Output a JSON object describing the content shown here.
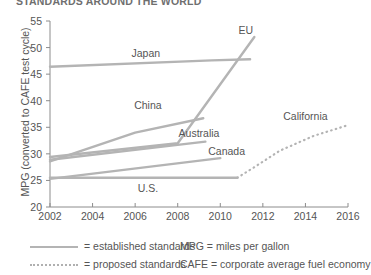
{
  "title": "STANDARDS AROUND THE WORLD",
  "chart_data": {
    "type": "line",
    "title": "STANDARDS AROUND THE WORLD",
    "xlabel": "",
    "ylabel": "MPG (converted to CAFE test cycle)",
    "xlim": [
      2002,
      2016
    ],
    "ylim": [
      20,
      55
    ],
    "xticks": [
      "2002",
      "2004",
      "2006",
      "2008",
      "2010",
      "2012",
      "2014",
      "2016"
    ],
    "yticks": [
      "55",
      "50",
      "45",
      "40",
      "35",
      "30",
      "25",
      "20"
    ],
    "grid": false,
    "legend_position": "below-axis",
    "series": [
      {
        "name": "EU",
        "style": "established",
        "label_x": 2011.2,
        "label_y": 53.4,
        "points": [
          [
            2002,
            29.4
          ],
          [
            2008,
            32.0
          ],
          [
            2011.6,
            52.0
          ]
        ]
      },
      {
        "name": "Japan",
        "style": "established",
        "label_x": 2006.5,
        "label_y": 49.0,
        "points": [
          [
            2002,
            46.4
          ],
          [
            2009.6,
            47.6
          ],
          [
            2011.4,
            47.8
          ]
        ]
      },
      {
        "name": "China",
        "style": "established",
        "label_x": 2006.6,
        "label_y": 39.2,
        "points": [
          [
            2002,
            28.6
          ],
          [
            2006.0,
            34.0
          ],
          [
            2009.2,
            36.7
          ]
        ]
      },
      {
        "name": "Australia",
        "style": "established",
        "label_x": 2009.0,
        "label_y": 34.0,
        "points": [
          [
            2002,
            28.9
          ],
          [
            2009.3,
            32.3
          ]
        ]
      },
      {
        "name": "Canada",
        "style": "established",
        "label_x": 2010.3,
        "label_y": 30.5,
        "points": [
          [
            2002,
            25.3
          ],
          [
            2010.0,
            29.2
          ]
        ]
      },
      {
        "name": "U.S.",
        "style": "established",
        "label_x": 2006.6,
        "label_y": 23.6,
        "points": [
          [
            2002,
            25.5
          ],
          [
            2010.8,
            25.5
          ]
        ]
      },
      {
        "name": "California",
        "style": "proposed",
        "label_x": 2014.0,
        "label_y": 37.2,
        "points": [
          [
            2010.8,
            25.5
          ],
          [
            2011.6,
            27.5
          ],
          [
            2012.8,
            30.6
          ],
          [
            2014.4,
            33.4
          ],
          [
            2016.0,
            35.4
          ]
        ]
      }
    ],
    "legend": [
      {
        "key": "established-standards",
        "marker": "solid-line",
        "text": "= established standards"
      },
      {
        "key": "proposed-standards",
        "marker": "dotted-line",
        "text": "= proposed standards"
      },
      {
        "key": "mpg-definition",
        "marker": "none",
        "text": "MPG = miles per gallon"
      },
      {
        "key": "cafe-definition",
        "marker": "none",
        "text": "CAFE = corporate average fuel economy"
      }
    ]
  },
  "colors": {
    "line": "#b4b4b4",
    "axis": "#8c8c8c",
    "text": "#555555",
    "title": "#6f6f6f"
  }
}
